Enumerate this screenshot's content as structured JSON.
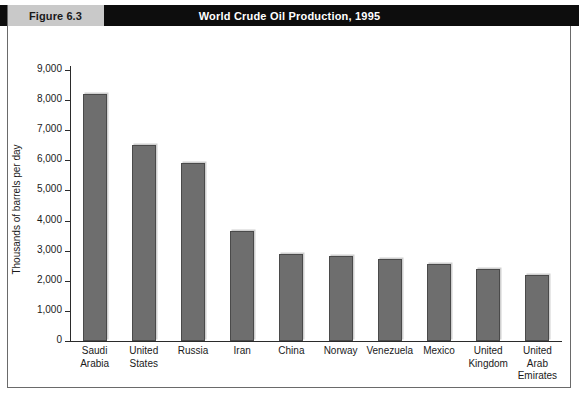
{
  "figure": {
    "tag": "Figure 6.3",
    "title": "World Crude Oil Production, 1995"
  },
  "colors": {
    "banner_background": "#0d0d0d",
    "banner_text": "#ffffff",
    "tag_background": "#c9c9c9",
    "bar_fill": "#6e6e6e",
    "bar_border": "#4a4a4a",
    "axis": "#2b2b2b",
    "frame": "#6a6a6a"
  },
  "chart_data": {
    "type": "bar",
    "title": "World Crude Oil Production, 1995",
    "xlabel": "",
    "ylabel": "Thousands of barrels per day",
    "ylim": [
      0,
      9000
    ],
    "ytick_labels": [
      "9,000",
      "8,000",
      "7,000",
      "6,000",
      "5,000",
      "4,000",
      "3,000",
      "2,000",
      "1,000",
      "0"
    ],
    "ytick_values": [
      9000,
      8000,
      7000,
      6000,
      5000,
      4000,
      3000,
      2000,
      1000,
      0
    ],
    "grid": false,
    "legend": null,
    "categories": [
      "Saudi Arabia",
      "United States",
      "Russia",
      "Iran",
      "China",
      "Norway",
      "Venezuela",
      "Mexico",
      "United Kingdom",
      "United Arab Emirates"
    ],
    "category_lines": [
      [
        "Saudi",
        "Arabia"
      ],
      [
        "United",
        "States"
      ],
      [
        "Russia"
      ],
      [
        "Iran"
      ],
      [
        "China"
      ],
      [
        "Norway"
      ],
      [
        "Venezuela"
      ],
      [
        "Mexico"
      ],
      [
        "United",
        "Kingdom"
      ],
      [
        "United",
        "Arab",
        "Emirates"
      ]
    ],
    "values": [
      8200,
      6500,
      5900,
      3650,
      2900,
      2830,
      2730,
      2570,
      2400,
      2180
    ]
  }
}
